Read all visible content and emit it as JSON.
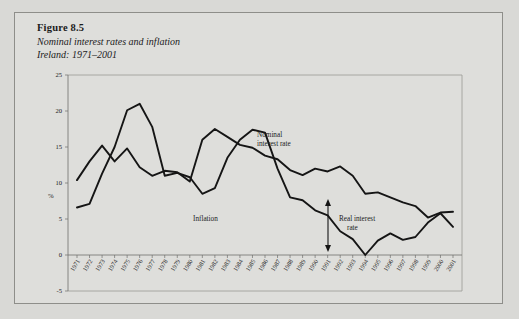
{
  "figure": {
    "number": "Figure 8.5",
    "subtitle": "Nominal interest rates and inflation",
    "subtitle2": "Ireland: 1971–2001"
  },
  "annotations": {
    "nominal_line1": "Nominal",
    "nominal_line2": "interest rate",
    "inflation": "Inflation",
    "real_line1": "Real interest",
    "real_line2": "rate",
    "arrow": "double-headed-arrow"
  },
  "chart_data": {
    "type": "line",
    "title": "Nominal interest rates and inflation",
    "subtitle": "Ireland: 1971–2001",
    "xlabel": "",
    "ylabel": "%",
    "ylim": [
      -5,
      25
    ],
    "yticks": [
      -5,
      0,
      5,
      10,
      15,
      20,
      25
    ],
    "ytick_labels": [
      "-5",
      "0",
      "5",
      "10",
      "15",
      "20",
      "25"
    ],
    "grid": false,
    "legend": "inline-annotations",
    "categories": [
      "1971",
      "1972",
      "1973",
      "1974",
      "1975",
      "1976",
      "1977",
      "1978",
      "1979",
      "1980",
      "1981",
      "1982",
      "1983",
      "1984",
      "1985",
      "1986",
      "1987",
      "1988",
      "1989",
      "1990",
      "1991",
      "1992",
      "1993",
      "1994",
      "1995",
      "1996",
      "1997",
      "1998",
      "1999",
      "2000",
      "2001"
    ],
    "series": [
      {
        "name": "Nominal interest rate",
        "values": [
          10.4,
          13.0,
          15.2,
          13.0,
          14.8,
          12.2,
          11.0,
          11.7,
          11.5,
          10.2,
          16.0,
          17.5,
          16.4,
          15.3,
          14.9,
          13.8,
          13.3,
          11.8,
          11.1,
          12.0,
          11.6,
          12.3,
          11.0,
          8.5,
          8.7,
          8.0,
          7.3,
          6.8,
          5.2,
          5.9,
          6.0
        ]
      },
      {
        "name": "Inflation",
        "values": [
          6.6,
          7.1,
          11.3,
          15.0,
          20.1,
          21.0,
          17.8,
          11.0,
          11.4,
          10.8,
          8.5,
          9.3,
          13.5,
          16.0,
          17.4,
          17.0,
          12.0,
          8.0,
          7.6,
          6.2,
          5.5,
          3.3,
          2.2,
          0.0,
          2.0,
          3.0,
          2.1,
          2.5,
          4.5,
          5.8,
          3.9
        ]
      }
    ],
    "annotations": [
      {
        "text": "Nominal interest rate",
        "series": "Nominal interest rate"
      },
      {
        "text": "Inflation",
        "series": "Inflation"
      },
      {
        "text": "Real interest rate",
        "type": "gap-arrow",
        "between": [
          "Nominal interest rate",
          "Inflation"
        ],
        "at": "1990"
      }
    ]
  }
}
